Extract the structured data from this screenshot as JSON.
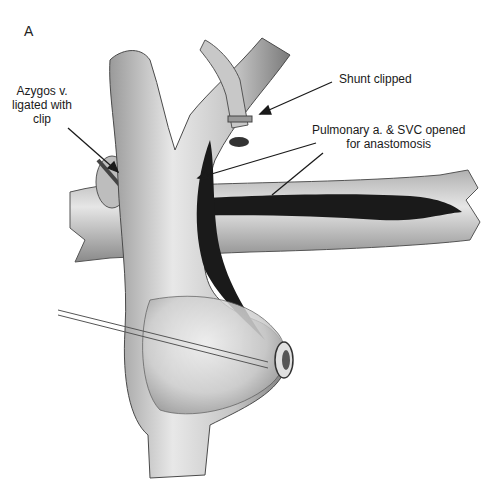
{
  "figure": {
    "panel_letter": "A",
    "labels": {
      "azygos": [
        "Azygos v.",
        "ligated with",
        "clip"
      ],
      "shunt": "Shunt clipped",
      "pulmonary": [
        "Pulmonary a. & SVC opened",
        "for anastomosis"
      ]
    },
    "colors": {
      "background": "#ffffff",
      "vessel_fill": "#d9d9d9",
      "vessel_shade": "#8c8c8c",
      "lumen": "#1a1a1a",
      "text": "#1a1a1a"
    }
  }
}
